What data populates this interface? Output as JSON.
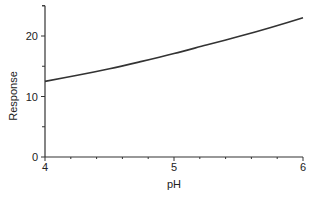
{
  "chart_data": {
    "type": "line",
    "title": "",
    "xlabel": "pH",
    "ylabel": "Response",
    "xlim": [
      4,
      6
    ],
    "ylim": [
      0,
      25
    ],
    "x_ticks": [
      4,
      5,
      6
    ],
    "x_tick_labels": [
      "4",
      "5",
      "6"
    ],
    "x_minor_step": 0.2,
    "y_ticks": [
      0,
      10,
      20
    ],
    "y_tick_labels": [
      "0",
      "10",
      "20"
    ],
    "y_minor_step": 5,
    "grid": false,
    "legend": null,
    "series": [
      {
        "name": "Response",
        "x": [
          4.0,
          4.25,
          4.5,
          4.75,
          5.0,
          5.25,
          5.5,
          5.75,
          6.0
        ],
        "values": [
          12.5,
          13.5,
          14.6,
          15.8,
          17.1,
          18.5,
          19.9,
          21.4,
          23.0
        ]
      }
    ]
  }
}
